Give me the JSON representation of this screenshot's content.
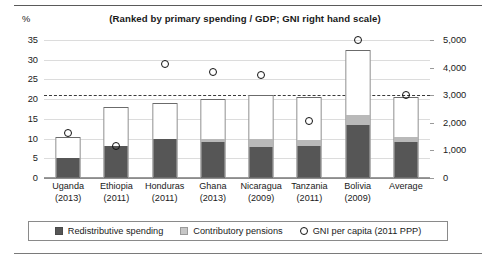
{
  "chart_data": {
    "type": "bar",
    "title": "(Ranked by primary spending / GDP; GNI right hand scale)",
    "unit_label": "%",
    "xlabel": "",
    "ylabel": "%",
    "ylabel_right": "",
    "ylim": [
      0,
      35
    ],
    "ylim_right": [
      0,
      5000
    ],
    "yticks": [
      "0",
      "5",
      "10",
      "15",
      "20",
      "25",
      "30",
      "35"
    ],
    "ytick_values": [
      0,
      5,
      10,
      15,
      20,
      25,
      30,
      35
    ],
    "yticks_right": [
      "0",
      "1,000",
      "2,000",
      "3,000",
      "4,000",
      "5,000"
    ],
    "ytick_values_right": [
      0,
      1000,
      2000,
      3000,
      4000,
      5000
    ],
    "grid": true,
    "legend_position": "bottom",
    "reference_line": {
      "label": "",
      "value": 21.0,
      "style": "dashed"
    },
    "categories": [
      "Uganda",
      "Ethiopia",
      "Honduras",
      "Ghana",
      "Nicaragua",
      "Tanzania",
      "Bolivia",
      "Average"
    ],
    "category_years": [
      "(2013)",
      "(2011)",
      "(2011)",
      "(2013)",
      "(2009)",
      "(2011)",
      "(2009)",
      ""
    ],
    "series": [
      {
        "name": "Redistributive spending",
        "type": "bar-segment",
        "color": "#565656",
        "values": [
          5.0,
          8.0,
          10.0,
          9.0,
          7.8,
          8.0,
          13.5,
          9.0
        ]
      },
      {
        "name": "Contributory pensions",
        "type": "bar-segment",
        "color": "#b9b9b9",
        "values": [
          0.0,
          0.0,
          0.0,
          0.8,
          2.2,
          1.5,
          2.5,
          1.5
        ]
      },
      {
        "name": "Primary spending total",
        "type": "bar-total",
        "color": "#ffffff",
        "values": [
          10.5,
          18.0,
          19.0,
          20.0,
          21.0,
          20.5,
          32.5,
          20.5
        ]
      },
      {
        "name": "GNI per capita (2011 PPP)",
        "type": "scatter",
        "color": "#111111",
        "axis": "right",
        "values": [
          1650,
          1150,
          4150,
          3850,
          3700,
          2100,
          5000,
          3000
        ],
        "values_left_scale": [
          11.5,
          8.0,
          29.0,
          27.0,
          26.0,
          14.5,
          35.0,
          21.0
        ]
      }
    ]
  },
  "legend": {
    "items": [
      {
        "label": "Redistributive spending",
        "marker": "square-dark"
      },
      {
        "label": "Contributory pensions",
        "marker": "square-light"
      },
      {
        "label": "GNI per capita (2011 PPP)",
        "marker": "circle-open"
      }
    ]
  },
  "colors": {
    "redistributive": "#565656",
    "pensions": "#b9b9b9",
    "bar_fill": "#ffffff",
    "bar_border": "#6b6b6b",
    "marker": "#111111",
    "gridline": "#dcdcdc",
    "axis": "#8c8c8c"
  }
}
